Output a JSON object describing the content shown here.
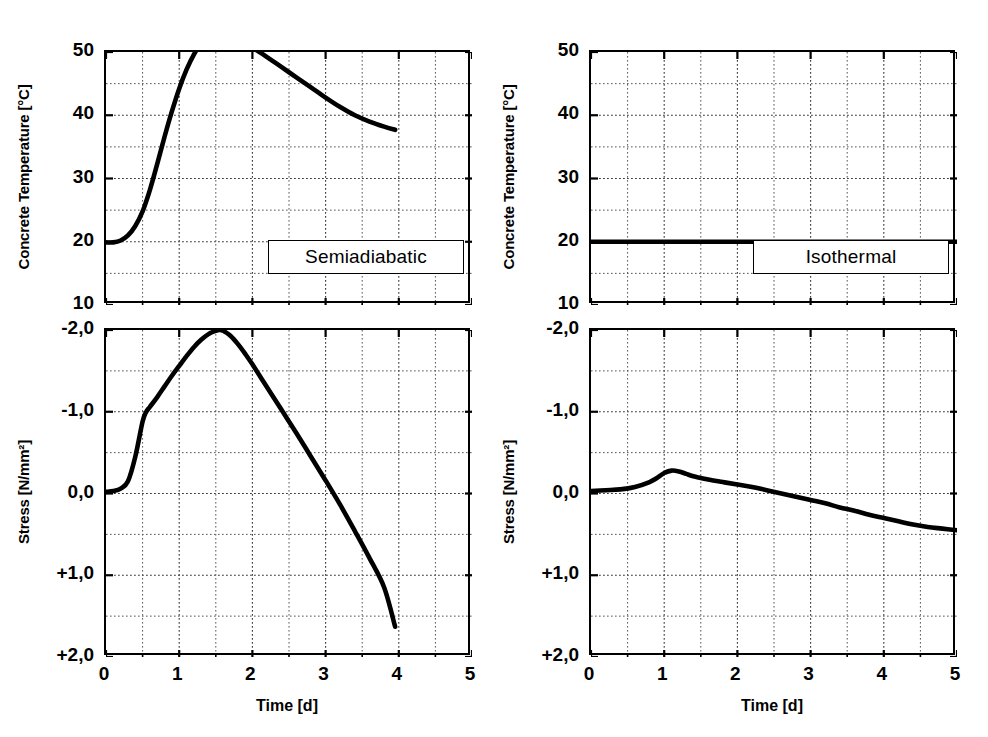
{
  "figure": {
    "background": "#ffffff",
    "ink": "#000000"
  },
  "chart_data": [
    {
      "id": "semiadiabatic-temperature",
      "type": "line",
      "title": "Semiadiabatic",
      "xlabel": "",
      "ylabel": "Concrete Temperature [°C]",
      "xlim": [
        0,
        5
      ],
      "ylim": [
        10,
        50
      ],
      "y_inverted": false,
      "grid": true,
      "xticks": [
        0,
        1,
        2,
        3,
        4,
        5
      ],
      "xticklabels": [
        "0",
        "1",
        "2",
        "3",
        "4",
        "5"
      ],
      "yticks": [
        10,
        20,
        30,
        40,
        50
      ],
      "yticklabels": [
        "10",
        "20",
        "30",
        "40",
        "50"
      ],
      "y_minor_ticks": [
        15,
        25,
        35,
        45
      ],
      "x_minor_ticks": [
        0.5,
        1.5,
        2.5,
        3.5,
        4.5
      ],
      "legend_position": "lower-right",
      "series": [
        {
          "name": "Concrete temperature",
          "x": [
            0.0,
            0.1,
            0.2,
            0.3,
            0.4,
            0.5,
            0.6,
            0.7,
            0.8,
            0.9,
            1.0,
            1.1,
            1.2,
            1.3,
            1.4,
            1.5,
            1.6,
            1.7,
            1.8,
            1.9,
            2.0,
            2.2,
            2.4,
            2.6,
            2.8,
            3.0,
            3.2,
            3.4,
            3.6,
            3.8,
            3.95
          ],
          "values": [
            19.9,
            19.9,
            20.2,
            21.0,
            22.5,
            24.8,
            28.2,
            32.3,
            36.6,
            40.6,
            44.2,
            47.2,
            49.6,
            51.3,
            52.2,
            52.6,
            52.7,
            52.5,
            52.1,
            51.5,
            50.7,
            49.2,
            47.6,
            46.0,
            44.4,
            42.8,
            41.3,
            40.0,
            39.0,
            38.2,
            37.7
          ]
        }
      ]
    },
    {
      "id": "isothermal-temperature",
      "type": "line",
      "title": "Isothermal",
      "xlabel": "",
      "ylabel": "Concrete Temperature [°C]",
      "xlim": [
        0,
        5
      ],
      "ylim": [
        10,
        50
      ],
      "y_inverted": false,
      "grid": true,
      "xticks": [
        0,
        1,
        2,
        3,
        4,
        5
      ],
      "xticklabels": [
        "0",
        "1",
        "2",
        "3",
        "4",
        "5"
      ],
      "yticks": [
        10,
        20,
        30,
        40,
        50
      ],
      "yticklabels": [
        "10",
        "20",
        "30",
        "40",
        "50"
      ],
      "y_minor_ticks": [
        15,
        25,
        35,
        45
      ],
      "x_minor_ticks": [
        0.5,
        1.5,
        2.5,
        3.5,
        4.5
      ],
      "legend_position": "lower-right",
      "series": [
        {
          "name": "Concrete temperature",
          "x": [
            0.0,
            1.0,
            2.0,
            3.0,
            4.0,
            5.0
          ],
          "values": [
            20.0,
            20.0,
            20.0,
            20.0,
            20.0,
            20.0
          ]
        }
      ]
    },
    {
      "id": "semiadiabatic-stress",
      "type": "line",
      "title": "",
      "xlabel": "Time [d]",
      "ylabel": "Stress [N/mm²]",
      "xlim": [
        0,
        5
      ],
      "ylim": [
        -2.0,
        2.0
      ],
      "y_inverted": true,
      "grid": true,
      "xticks": [
        0,
        1,
        2,
        3,
        4,
        5
      ],
      "xticklabels": [
        "0",
        "1",
        "2",
        "3",
        "4",
        "5"
      ],
      "yticks": [
        -2.0,
        -1.0,
        0.0,
        1.0,
        2.0
      ],
      "yticklabels": [
        "-2,0",
        "-1,0",
        "0,0",
        "+1,0",
        "+2,0"
      ],
      "y_minor_ticks": [
        -1.5,
        -0.5,
        0.5,
        1.5
      ],
      "x_minor_ticks": [
        0.5,
        1.5,
        2.5,
        3.5,
        4.5
      ],
      "series": [
        {
          "name": "Stress",
          "x": [
            0.0,
            0.1,
            0.2,
            0.3,
            0.4,
            0.5,
            0.55,
            0.6,
            0.7,
            0.8,
            0.9,
            1.0,
            1.1,
            1.2,
            1.3,
            1.4,
            1.5,
            1.55,
            1.6,
            1.7,
            1.8,
            1.9,
            2.0,
            2.2,
            2.4,
            2.6,
            2.8,
            3.0,
            3.2,
            3.4,
            3.6,
            3.8,
            3.95
          ],
          "values": [
            -0.02,
            -0.03,
            -0.06,
            -0.15,
            -0.45,
            -0.88,
            -1.0,
            -1.06,
            -1.18,
            -1.31,
            -1.44,
            -1.56,
            -1.68,
            -1.79,
            -1.88,
            -1.95,
            -1.99,
            -2.0,
            -1.99,
            -1.93,
            -1.83,
            -1.71,
            -1.58,
            -1.3,
            -1.02,
            -0.74,
            -0.45,
            -0.16,
            0.14,
            0.46,
            0.79,
            1.15,
            1.63
          ]
        }
      ]
    },
    {
      "id": "isothermal-stress",
      "type": "line",
      "title": "",
      "xlabel": "Time [d]",
      "ylabel": "Stress [N/mm²]",
      "xlim": [
        0,
        5
      ],
      "ylim": [
        -2.0,
        2.0
      ],
      "y_inverted": true,
      "grid": true,
      "xticks": [
        0,
        1,
        2,
        3,
        4,
        5
      ],
      "xticklabels": [
        "0",
        "1",
        "2",
        "3",
        "4",
        "5"
      ],
      "yticks": [
        -2.0,
        -1.0,
        0.0,
        1.0,
        2.0
      ],
      "yticklabels": [
        "-2,0",
        "-1,0",
        "0,0",
        "+1,0",
        "+2,0"
      ],
      "y_minor_ticks": [
        -1.5,
        -0.5,
        0.5,
        1.5
      ],
      "x_minor_ticks": [
        0.5,
        1.5,
        2.5,
        3.5,
        4.5
      ],
      "series": [
        {
          "name": "Stress",
          "x": [
            0.0,
            0.2,
            0.4,
            0.6,
            0.8,
            0.9,
            1.0,
            1.1,
            1.2,
            1.3,
            1.4,
            1.5,
            1.6,
            1.8,
            2.0,
            2.2,
            2.4,
            2.6,
            2.8,
            3.0,
            3.2,
            3.4,
            3.6,
            3.8,
            4.0,
            4.2,
            4.4,
            4.6,
            4.8,
            5.0
          ],
          "values": [
            -0.03,
            -0.04,
            -0.05,
            -0.08,
            -0.14,
            -0.19,
            -0.25,
            -0.28,
            -0.27,
            -0.24,
            -0.21,
            -0.19,
            -0.17,
            -0.14,
            -0.11,
            -0.08,
            -0.04,
            0.0,
            0.04,
            0.08,
            0.12,
            0.17,
            0.21,
            0.26,
            0.3,
            0.34,
            0.38,
            0.41,
            0.43,
            0.45
          ]
        }
      ]
    }
  ],
  "panels": {
    "top_left": {
      "ylabel": "Concrete Temperature [°C]",
      "legend": "Semiadiabatic",
      "yticklabels": [
        "50",
        "40",
        "30",
        "20",
        "10"
      ]
    },
    "top_right": {
      "ylabel": "Concrete Temperature [°C]",
      "legend": "Isothermal",
      "yticklabels": [
        "50",
        "40",
        "30",
        "20",
        "10"
      ]
    },
    "bottom_left": {
      "ylabel": "Stress [N/mm²]",
      "xlabel": "Time [d]",
      "yticklabels": [
        "-2,0",
        "-1,0",
        "0,0",
        "+1,0",
        "+2,0"
      ],
      "xticklabels": [
        "0",
        "1",
        "2",
        "3",
        "4",
        "5"
      ]
    },
    "bottom_right": {
      "ylabel": "Stress [N/mm²]",
      "xlabel": "Time [d]",
      "yticklabels": [
        "-2,0",
        "-1,0",
        "0,0",
        "+1,0",
        "+2,0"
      ],
      "xticklabels": [
        "0",
        "1",
        "2",
        "3",
        "4",
        "5"
      ]
    }
  }
}
